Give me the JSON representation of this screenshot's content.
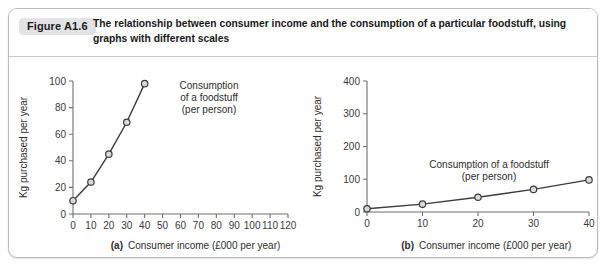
{
  "figure": {
    "number_label": "Figure A1.6",
    "caption": "The relationship between consumer income and the consumption of a particular foodstuff, using graphs with different scales"
  },
  "colors": {
    "frame_border": "#b9bcbe",
    "label_chip_bg": "#e2e3e4",
    "axis": "#6d6f71",
    "series_line": "#3b3b3d",
    "marker_fill": "#d8d9da",
    "text": "#2c2c2e"
  },
  "chart_data": [
    {
      "id": "panel-a",
      "type": "line",
      "panel_letter": "(a)",
      "title": "",
      "xlabel": "Consumer income (£000 per year)",
      "ylabel": "Kg purchased per year",
      "xlim": [
        0,
        120
      ],
      "ylim": [
        0,
        100
      ],
      "xticks": [
        0,
        10,
        20,
        30,
        40,
        50,
        60,
        70,
        80,
        90,
        100,
        110,
        120
      ],
      "yticks": [
        0,
        20,
        40,
        60,
        80,
        100
      ],
      "xticklabels": [
        "0",
        "10",
        "20",
        "30",
        "40",
        "50",
        "60",
        "70",
        "80",
        "90",
        "100",
        "110",
        "120"
      ],
      "yticklabels": [
        "0",
        "20",
        "40",
        "60",
        "80",
        "100"
      ],
      "grid": false,
      "legend": "none",
      "x": [
        0,
        10,
        20,
        30,
        40
      ],
      "values": [
        10,
        24,
        45,
        69,
        98
      ],
      "series": [
        {
          "name": "Consumption of a foodstuff (per person)",
          "values": [
            10,
            24,
            45,
            69,
            98
          ]
        }
      ],
      "annotation_lines": [
        "Consumption",
        "of a foodstuff",
        "(per person)"
      ]
    },
    {
      "id": "panel-b",
      "type": "line",
      "panel_letter": "(b)",
      "title": "",
      "xlabel": "Consumer income (£000 per year)",
      "ylabel": "Kg purchased per year",
      "xlim": [
        0,
        40
      ],
      "ylim": [
        0,
        400
      ],
      "xticks": [
        0,
        10,
        20,
        30,
        40
      ],
      "yticks": [
        0,
        100,
        200,
        300,
        400
      ],
      "xticklabels": [
        "0",
        "10",
        "20",
        "30",
        "40"
      ],
      "yticklabels": [
        "0",
        "100",
        "200",
        "300",
        "400"
      ],
      "grid": false,
      "legend": "none",
      "x": [
        0,
        10,
        20,
        30,
        40
      ],
      "values": [
        10,
        24,
        45,
        69,
        98
      ],
      "series": [
        {
          "name": "Consumption of a foodstuff (per person)",
          "values": [
            10,
            24,
            45,
            69,
            98
          ]
        }
      ],
      "annotation_lines": [
        "Consumption of a foodstuff",
        "(per person)"
      ]
    }
  ]
}
